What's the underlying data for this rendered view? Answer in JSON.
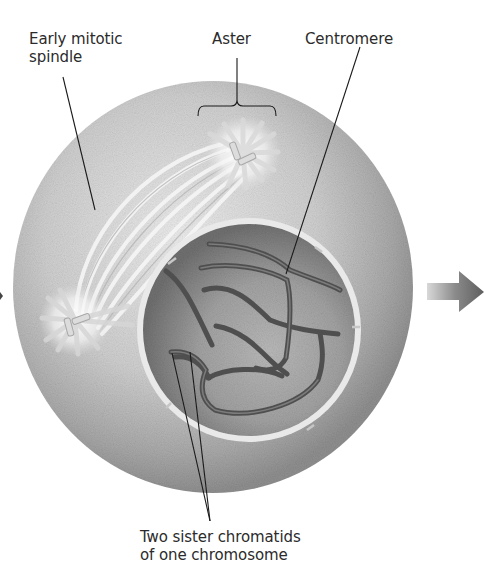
{
  "figure": {
    "labels": {
      "spindle": {
        "line1": "Early mitotic",
        "line2": "spindle"
      },
      "aster": "Aster",
      "centromere": "Centromere",
      "chromatids": {
        "line1": "Two sister chromatids",
        "line2": "of one chromosome"
      }
    },
    "icons": {
      "next_stage_arrow": "right-arrow-icon",
      "prev_stage_arrow": "arrowhead-left-edge"
    },
    "colors": {
      "background": "#ffffff",
      "cell_light": "#e6e6e6",
      "cell_mid": "#bdbdbd",
      "cell_dark": "#8e8e8e",
      "nucleus": "#7a7a7a",
      "nucleoplasm_light": "#b8b8b8",
      "envelope": "#eeeeee",
      "chromosome": "#5a5a5a",
      "spindle_fiber": "#f4f4f4",
      "leader_line": "#1a1a1a",
      "text": "#2b2b2b",
      "arrow": "#6b6b6b"
    }
  }
}
